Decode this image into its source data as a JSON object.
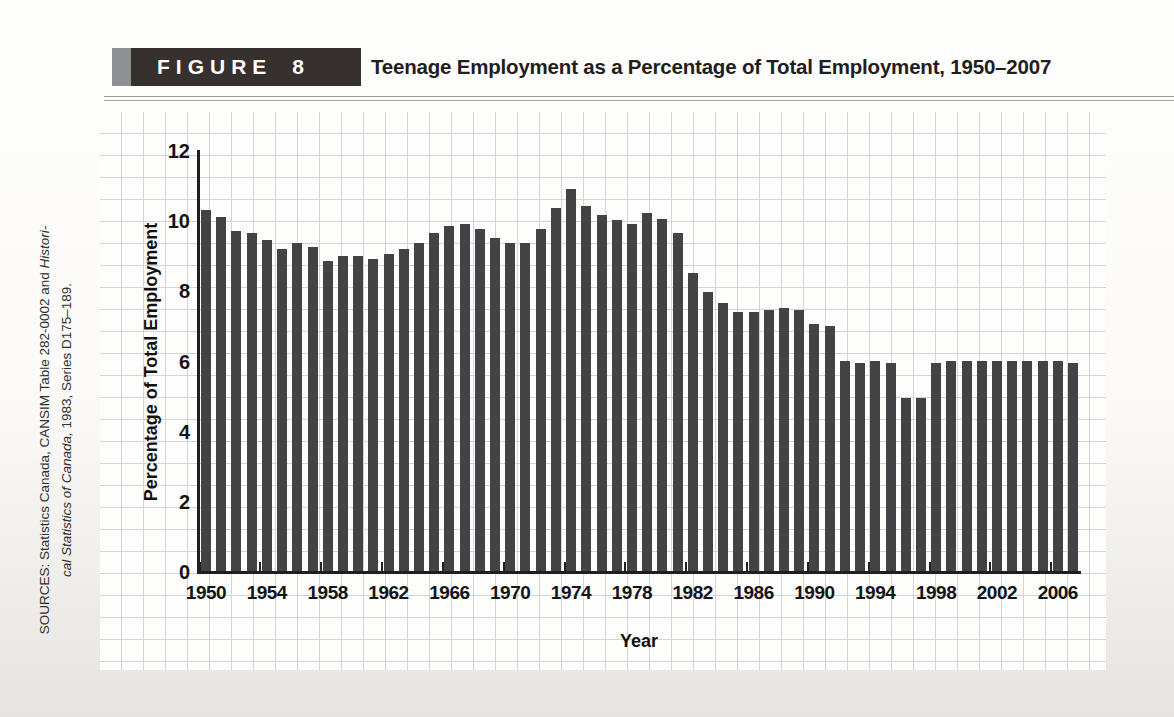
{
  "figure_label": {
    "word": "FIGURE",
    "number": "8"
  },
  "title": "Teenage Employment as a Percentage of Total Employment, 1950–2007",
  "source": {
    "line1_regular": "SOURCES: Statistics Canada, CANSIM Table 282-0002 and ",
    "line1_italic": "Histori-",
    "line2_italic": "cal Statistics of Canada,",
    "line2_regular": " 1983, Series D175–189."
  },
  "colors": {
    "bar": "#434345",
    "axis": "#1f1f1f",
    "figure_box": "#36302f",
    "figure_accent": "#8f9092",
    "grid_line": "#d3d5d8"
  },
  "chart_data": {
    "type": "bar",
    "title": "Teenage Employment as a Percentage of Total Employment, 1950–2007",
    "xlabel": "Year",
    "ylabel": "Percentage of Total Employment",
    "ylim": [
      0,
      12
    ],
    "ytick_interval": 2,
    "ytick_labels": [
      "0",
      "2",
      "4",
      "6",
      "8",
      "10",
      "12"
    ],
    "grid": "graph-paper background, not aligned to axis units",
    "legend": "none",
    "years": [
      1950,
      1951,
      1952,
      1953,
      1954,
      1955,
      1956,
      1957,
      1958,
      1959,
      1960,
      1961,
      1962,
      1963,
      1964,
      1965,
      1966,
      1967,
      1968,
      1969,
      1970,
      1971,
      1972,
      1973,
      1974,
      1975,
      1976,
      1977,
      1978,
      1979,
      1980,
      1981,
      1982,
      1983,
      1984,
      1985,
      1986,
      1987,
      1988,
      1989,
      1990,
      1991,
      1992,
      1993,
      1994,
      1995,
      1996,
      1997,
      1998,
      1999,
      2000,
      2001,
      2002,
      2003,
      2004,
      2005,
      2006,
      2007
    ],
    "values": [
      10.35,
      10.15,
      9.75,
      9.7,
      9.5,
      9.25,
      9.4,
      9.3,
      8.9,
      9.05,
      9.05,
      8.95,
      9.1,
      9.25,
      9.4,
      9.7,
      9.9,
      9.95,
      9.8,
      9.55,
      9.4,
      9.4,
      9.8,
      10.4,
      10.95,
      10.45,
      10.2,
      10.05,
      9.95,
      10.25,
      10.1,
      9.7,
      8.55,
      8.0,
      7.7,
      7.45,
      7.45,
      7.5,
      7.55,
      7.5,
      7.1,
      7.05,
      6.05,
      6.0,
      6.05,
      6.0,
      5.0,
      5.0,
      6.0,
      6.05,
      6.05,
      6.05,
      6.05,
      6.05,
      6.05,
      6.05,
      6.05,
      6.0
    ],
    "x_axis_labels": [
      "1950",
      "1954",
      "1958",
      "1962",
      "1966",
      "1970",
      "1974",
      "1978",
      "1982",
      "1986",
      "1990",
      "1994",
      "1998",
      "2002",
      "2006"
    ]
  }
}
